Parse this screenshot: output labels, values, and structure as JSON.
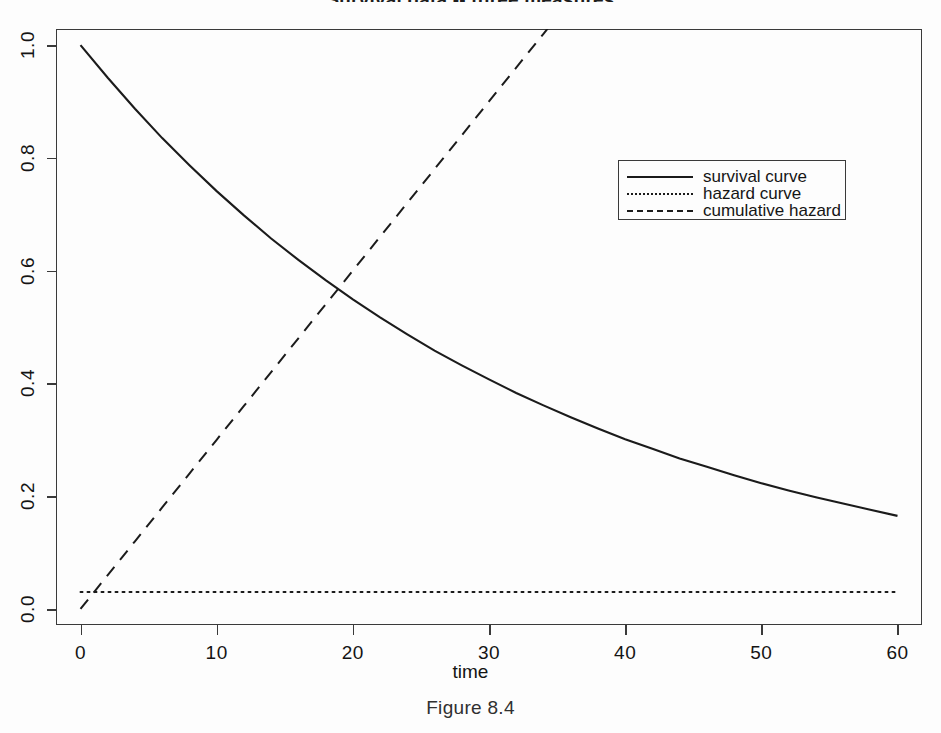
{
  "figure": {
    "title": "Survival data -- three measures",
    "caption": "Figure 8.4"
  },
  "axes": {
    "xlabel": "time",
    "ylabel": "",
    "xticks": [
      "0",
      "10",
      "20",
      "30",
      "40",
      "50",
      "60"
    ],
    "yticks": [
      "0.0",
      "0.2",
      "0.4",
      "0.6",
      "0.8",
      "1.0"
    ]
  },
  "legend": {
    "items": [
      {
        "label": "survival curve",
        "style": "solid"
      },
      {
        "label": "hazard curve",
        "style": "dotted"
      },
      {
        "label": "cumulative hazard",
        "style": "dashed"
      }
    ]
  },
  "chart_data": {
    "type": "line",
    "title": "Survival data -- three measures",
    "xlabel": "time",
    "ylabel": "",
    "xlim": [
      -1.8,
      61.8
    ],
    "ylim": [
      -0.0285,
      1.0285
    ],
    "xticks": [
      0,
      10,
      20,
      30,
      40,
      50,
      60
    ],
    "yticks": [
      0.0,
      0.2,
      0.4,
      0.6,
      0.8,
      1.0
    ],
    "grid": false,
    "legend_position": "upper right inside",
    "annotations": [
      "survival and cumulative-hazard curves cross near t=19 at value 0.565",
      "cumulative hazard leaves the top of the panel near t=35",
      "hazard is constant at 0.03"
    ],
    "x": [
      0,
      2,
      4,
      6,
      8,
      10,
      12,
      14,
      16,
      18,
      20,
      22,
      24,
      26,
      28,
      30,
      32,
      34,
      36,
      38,
      40,
      42,
      44,
      46,
      48,
      50,
      52,
      54,
      56,
      58,
      60
    ],
    "series": [
      {
        "name": "survival curve",
        "style": "solid",
        "color": "#1b1b1b",
        "values": [
          1.0,
          0.942,
          0.887,
          0.835,
          0.787,
          0.741,
          0.698,
          0.657,
          0.619,
          0.583,
          0.549,
          0.517,
          0.487,
          0.458,
          0.432,
          0.407,
          0.383,
          0.361,
          0.34,
          0.32,
          0.301,
          0.284,
          0.267,
          0.252,
          0.237,
          0.223,
          0.21,
          0.198,
          0.187,
          0.176,
          0.165
        ]
      },
      {
        "name": "hazard curve",
        "style": "dotted",
        "color": "#1b1b1b",
        "values": [
          0.03,
          0.03,
          0.03,
          0.03,
          0.03,
          0.03,
          0.03,
          0.03,
          0.03,
          0.03,
          0.03,
          0.03,
          0.03,
          0.03,
          0.03,
          0.03,
          0.03,
          0.03,
          0.03,
          0.03,
          0.03,
          0.03,
          0.03,
          0.03,
          0.03,
          0.03,
          0.03,
          0.03,
          0.03,
          0.03,
          0.03
        ]
      },
      {
        "name": "cumulative hazard",
        "style": "dashed",
        "color": "#1b1b1b",
        "values": [
          0.0,
          0.06,
          0.12,
          0.18,
          0.24,
          0.3,
          0.36,
          0.42,
          0.48,
          0.54,
          0.6,
          0.66,
          0.72,
          0.78,
          0.84,
          0.9,
          0.96,
          1.02,
          1.08,
          1.14,
          1.2,
          1.26,
          1.32,
          1.38,
          1.44,
          1.5,
          1.56,
          1.62,
          1.68,
          1.74,
          1.8
        ]
      }
    ]
  }
}
